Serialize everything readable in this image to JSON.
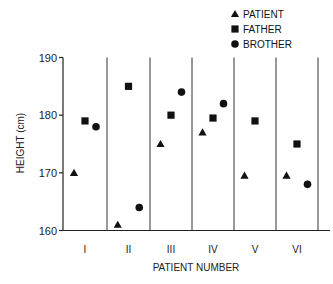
{
  "chart_data": {
    "type": "scatter",
    "title": "",
    "xlabel": "PATIENT NUMBER",
    "ylabel": "HEIGHT (cm)",
    "categories": [
      "I",
      "II",
      "III",
      "IV",
      "V",
      "VI"
    ],
    "ylim": [
      160,
      190
    ],
    "yticks": [
      160,
      170,
      180,
      190
    ],
    "grid": false,
    "category_dividers": true,
    "legend_position": "top-right",
    "series": [
      {
        "name": "PATIENT",
        "marker": "triangle",
        "values": [
          170,
          161,
          175,
          177,
          169.5,
          169.5
        ]
      },
      {
        "name": "FATHER",
        "marker": "square",
        "values": [
          179,
          185,
          180,
          179.5,
          179,
          175
        ]
      },
      {
        "name": "BROTHER",
        "marker": "circle",
        "values": [
          178,
          164,
          184,
          182,
          null,
          168
        ]
      }
    ]
  },
  "colors": {
    "marker": "#111111",
    "axis": "#222222",
    "background": "#ffffff"
  }
}
